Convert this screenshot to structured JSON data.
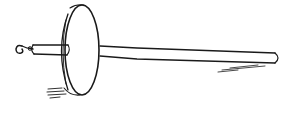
{
  "image": {
    "subject": "drop spindle",
    "description": "Line drawing of a drop spindle with a hook at the left end, a short thick shaft, a large disk whorl, and a long thin shaft extending to the right",
    "style": "black ink line illustration on white",
    "colors": {
      "background": "#ffffff",
      "ink": "#1a1a1a"
    },
    "parts": [
      "hook",
      "short-shaft",
      "whorl-disk",
      "long-shaft",
      "shadow-hatching"
    ]
  }
}
